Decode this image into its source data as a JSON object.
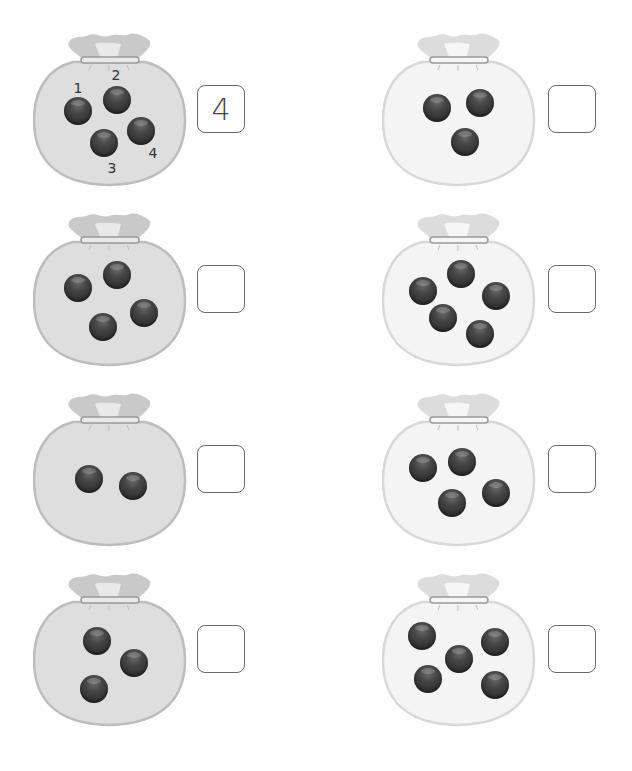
{
  "colors": {
    "bag_left_fill": "#dedede",
    "bag_left_stroke": "#bdbdbd",
    "bag_right_fill": "#f4f4f4",
    "bag_right_stroke": "#d8d8d8",
    "marble": "#333333",
    "box_border": "#6a6a6a"
  },
  "items": [
    {
      "name": "bag-1",
      "x": 33,
      "y": 32,
      "tone": "left",
      "answer": "4",
      "marbles": [
        [
          45,
          79
        ],
        [
          84,
          68
        ],
        [
          71,
          111
        ],
        [
          108,
          99
        ]
      ],
      "labels": [
        {
          "text": "1",
          "x": 45,
          "y": 56
        },
        {
          "text": "2",
          "x": 83,
          "y": 43
        },
        {
          "text": "3",
          "x": 79,
          "y": 136
        },
        {
          "text": "4",
          "x": 120,
          "y": 121
        }
      ]
    },
    {
      "name": "bag-2",
      "x": 382,
      "y": 32,
      "tone": "right",
      "answer": "",
      "marbles": [
        [
          55,
          76
        ],
        [
          98,
          71
        ],
        [
          83,
          110
        ]
      ],
      "labels": []
    },
    {
      "name": "bag-3",
      "x": 33,
      "y": 212,
      "tone": "left",
      "answer": "",
      "marbles": [
        [
          45,
          76
        ],
        [
          84,
          63
        ],
        [
          70,
          115
        ],
        [
          111,
          101
        ]
      ],
      "labels": []
    },
    {
      "name": "bag-4",
      "x": 382,
      "y": 212,
      "tone": "right",
      "answer": "",
      "marbles": [
        [
          41,
          79
        ],
        [
          79,
          62
        ],
        [
          114,
          84
        ],
        [
          61,
          106
        ],
        [
          98,
          122
        ]
      ],
      "labels": []
    },
    {
      "name": "bag-5",
      "x": 33,
      "y": 392,
      "tone": "left",
      "answer": "",
      "marbles": [
        [
          56,
          87
        ],
        [
          100,
          94
        ]
      ],
      "labels": []
    },
    {
      "name": "bag-6",
      "x": 382,
      "y": 392,
      "tone": "right",
      "answer": "",
      "marbles": [
        [
          41,
          76
        ],
        [
          80,
          70
        ],
        [
          70,
          111
        ],
        [
          114,
          101
        ]
      ],
      "labels": []
    },
    {
      "name": "bag-7",
      "x": 33,
      "y": 572,
      "tone": "left",
      "answer": "",
      "marbles": [
        [
          64,
          69
        ],
        [
          101,
          91
        ],
        [
          61,
          117
        ]
      ],
      "labels": []
    },
    {
      "name": "bag-8",
      "x": 382,
      "y": 572,
      "tone": "right",
      "answer": "",
      "marbles": [
        [
          40,
          64
        ],
        [
          113,
          70
        ],
        [
          77,
          87
        ],
        [
          46,
          107
        ],
        [
          113,
          113
        ]
      ],
      "labels": []
    }
  ]
}
